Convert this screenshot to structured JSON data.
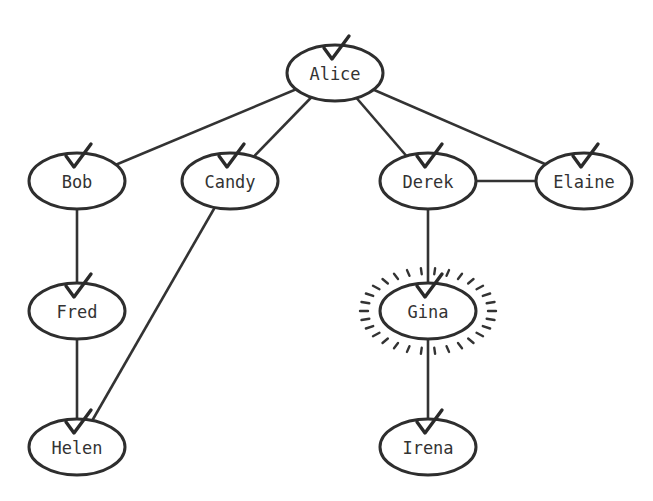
{
  "diagram": {
    "type": "graph",
    "highlighted_node": "Gina",
    "nodes": [
      {
        "id": "alice",
        "label": "Alice",
        "x": 335,
        "y": 73,
        "checked": true
      },
      {
        "id": "bob",
        "label": "Bob",
        "x": 77,
        "y": 181,
        "checked": true
      },
      {
        "id": "candy",
        "label": "Candy",
        "x": 230,
        "y": 181,
        "checked": true
      },
      {
        "id": "derek",
        "label": "Derek",
        "x": 428,
        "y": 181,
        "checked": true
      },
      {
        "id": "elaine",
        "label": "Elaine",
        "x": 584,
        "y": 181,
        "checked": true
      },
      {
        "id": "fred",
        "label": "Fred",
        "x": 77,
        "y": 311,
        "checked": true
      },
      {
        "id": "gina",
        "label": "Gina",
        "x": 428,
        "y": 311,
        "checked": true,
        "highlighted": true
      },
      {
        "id": "helen",
        "label": "Helen",
        "x": 77,
        "y": 447,
        "checked": true
      },
      {
        "id": "irena",
        "label": "Irena",
        "x": 428,
        "y": 447,
        "checked": true
      }
    ],
    "edges": [
      {
        "from": "alice",
        "to": "bob"
      },
      {
        "from": "alice",
        "to": "candy"
      },
      {
        "from": "alice",
        "to": "derek"
      },
      {
        "from": "alice",
        "to": "elaine"
      },
      {
        "from": "derek",
        "to": "elaine"
      },
      {
        "from": "bob",
        "to": "fred"
      },
      {
        "from": "fred",
        "to": "helen"
      },
      {
        "from": "candy",
        "to": "helen"
      },
      {
        "from": "derek",
        "to": "gina"
      },
      {
        "from": "gina",
        "to": "irena"
      }
    ]
  }
}
